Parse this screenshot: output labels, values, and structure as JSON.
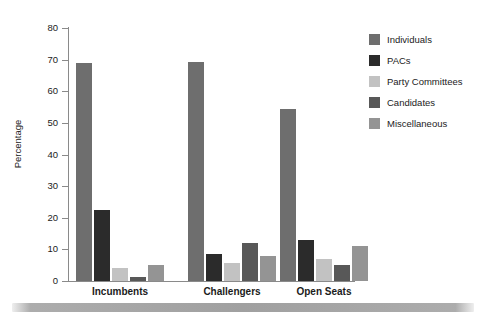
{
  "chart_data": {
    "type": "bar",
    "title": "",
    "xlabel": "",
    "ylabel": "Percentage",
    "ylim": [
      0,
      80
    ],
    "ytick_values": [
      80,
      70,
      60,
      50,
      40,
      30,
      20,
      10,
      0
    ],
    "ytick_labels": [
      "80",
      "70",
      "60",
      "50",
      "40",
      "30",
      "20",
      "10",
      "0"
    ],
    "grid": false,
    "legend_position": "right",
    "categories": [
      "Incumbents",
      "Challengers",
      "Open Seats"
    ],
    "series": [
      {
        "name": "Individuals",
        "color": "#6e6e6e",
        "values": [
          69.0,
          69.2,
          54.5
        ]
      },
      {
        "name": "PACs",
        "color": "#2b2b2b",
        "values": [
          22.3,
          8.5,
          13.0
        ]
      },
      {
        "name": "Party Committees",
        "color": "#c2c2c2",
        "values": [
          4.2,
          5.6,
          7.0
        ]
      },
      {
        "name": "Candidates",
        "color": "#585858",
        "values": [
          1.2,
          12.0,
          5.0
        ]
      },
      {
        "name": "Miscellaneous",
        "color": "#949494",
        "values": [
          5.2,
          8.0,
          11.0
        ]
      }
    ]
  },
  "legend": {
    "items": [
      {
        "label": "Individuals",
        "color": "#6e6e6e"
      },
      {
        "label": "PACs",
        "color": "#2b2b2b"
      },
      {
        "label": "Party Committees",
        "color": "#c2c2c2"
      },
      {
        "label": "Candidates",
        "color": "#585858"
      },
      {
        "label": "Miscellaneous",
        "color": "#949494"
      }
    ]
  },
  "axes": {
    "y_title": "Percentage",
    "axis_color": "#8a8a8a"
  }
}
